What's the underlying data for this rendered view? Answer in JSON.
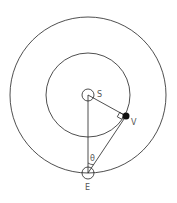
{
  "diagram": {
    "labels": {
      "sun": "S",
      "venus": "V",
      "earth": "E",
      "angle": "θ"
    },
    "colors": {
      "stroke": "#222222",
      "text": "#555555",
      "planet_fill": "#111111"
    }
  }
}
